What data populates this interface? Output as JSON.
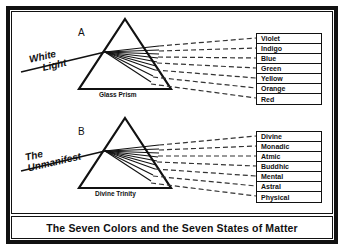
{
  "figure": {
    "caption": "The Seven Colors and the Seven States of Matter"
  },
  "diagram_a": {
    "letter": "A",
    "prism_caption": "Glass Prism",
    "ray_label_line1": "White",
    "ray_label_line2": "Light",
    "outputs": [
      "Violet",
      "Indigo",
      "Blue",
      "Green",
      "Yellow",
      "Orange",
      "Red"
    ]
  },
  "diagram_b": {
    "letter": "B",
    "prism_caption": "Divine Trinity",
    "ray_label_line1": "The",
    "ray_label_line2": "Unmanifest",
    "outputs": [
      "Divine",
      "Monadic",
      "Atmic",
      "Buddhic",
      "Mental",
      "Astral",
      "Physical"
    ]
  },
  "colors": {
    "ink": "#111111",
    "paper": "#ffffff"
  }
}
